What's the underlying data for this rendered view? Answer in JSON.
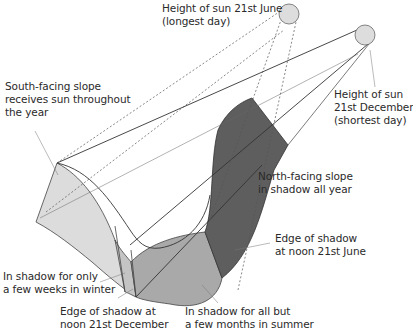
{
  "labels": {
    "sun_june": "Height of sun 21st June\n(longest day)",
    "sun_december": "Height of sun\n21st December\n(shortest day)",
    "south_slope": "South-facing slope\nreceives sun throughout\nthe year",
    "north_slope": "North-facing slope\nin shadow all year",
    "edge_june": "Edge of shadow\nat noon 21st June",
    "few_weeks": "In shadow for only\na few weeks in winter",
    "edge_december": "Edge of shadow at\nnoon 21st December",
    "all_but_summer": "In shadow for all but\na few months in summer"
  },
  "colors": {
    "south_slope_fill": "#dcdcdc",
    "few_weeks_fill": "#c4c4c4",
    "valley_floor_fill": "#a9a9a9",
    "north_slope_fill": "#5e5e5e",
    "sun_fill": "#dddddd",
    "line": "#3a3a3a"
  }
}
